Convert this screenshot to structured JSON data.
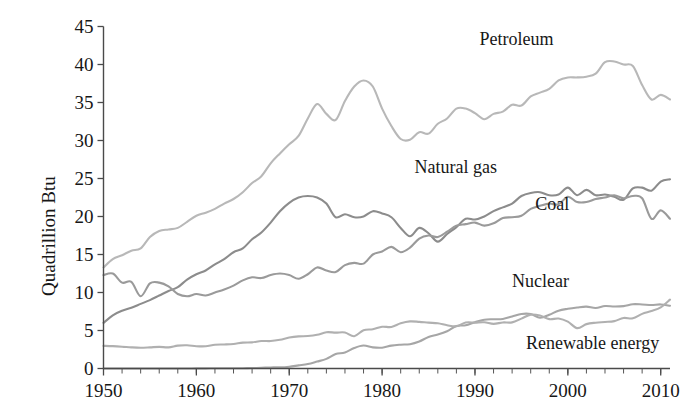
{
  "chart_data": {
    "type": "line",
    "title": "",
    "subtitle": "",
    "xlabel": "",
    "ylabel": "Quadrillion Btu",
    "xlim": [
      1950,
      2011
    ],
    "ylim": [
      0,
      45
    ],
    "grid": false,
    "legend_position": "inline-annotations",
    "y_ticks": [
      0,
      5,
      10,
      15,
      20,
      25,
      30,
      35,
      40,
      45
    ],
    "y_tick_labels": [
      "0",
      "5",
      "10",
      "15",
      "20",
      "25",
      "30",
      "35",
      "40",
      "45"
    ],
    "x_ticks": [
      1950,
      1960,
      1970,
      1980,
      1990,
      2000,
      2010
    ],
    "x_tick_labels": [
      "1950",
      "1960",
      "1970",
      "1980",
      "1990",
      "2000",
      "2010"
    ],
    "x_minor_tick_step": 2,
    "x": [
      1950,
      1951,
      1952,
      1953,
      1954,
      1955,
      1956,
      1957,
      1958,
      1959,
      1960,
      1961,
      1962,
      1963,
      1964,
      1965,
      1966,
      1967,
      1968,
      1969,
      1970,
      1971,
      1972,
      1973,
      1974,
      1975,
      1976,
      1977,
      1978,
      1979,
      1980,
      1981,
      1982,
      1983,
      1984,
      1985,
      1986,
      1987,
      1988,
      1989,
      1990,
      1991,
      1992,
      1993,
      1994,
      1995,
      1996,
      1997,
      1998,
      1999,
      2000,
      2001,
      2002,
      2003,
      2004,
      2005,
      2006,
      2007,
      2008,
      2009,
      2010,
      2011
    ],
    "series": [
      {
        "name": "Petroleum",
        "color": "#b8b8b8",
        "label_x": 1990.5,
        "label_y": 43.2,
        "values": [
          13.3,
          14.4,
          14.9,
          15.5,
          15.8,
          17.3,
          18.1,
          18.3,
          18.5,
          19.3,
          20.1,
          20.5,
          21.0,
          21.7,
          22.3,
          23.2,
          24.4,
          25.3,
          27.0,
          28.3,
          29.5,
          30.6,
          32.9,
          34.8,
          33.5,
          32.7,
          35.2,
          37.1,
          37.9,
          37.1,
          34.2,
          31.9,
          30.2,
          30.1,
          31.1,
          30.9,
          32.2,
          32.9,
          34.2,
          34.2,
          33.6,
          32.8,
          33.5,
          33.8,
          34.7,
          34.6,
          35.8,
          36.3,
          36.8,
          37.9,
          38.3,
          38.3,
          38.4,
          38.8,
          40.3,
          40.4,
          40.0,
          39.8,
          37.3,
          35.4,
          36.0,
          35.4
        ]
      },
      {
        "name": "Natural gas",
        "color": "#8c8c8c",
        "label_x": 1983.5,
        "label_y": 26.4,
        "values": [
          6.0,
          7.0,
          7.6,
          8.0,
          8.5,
          9.0,
          9.6,
          10.2,
          10.7,
          11.7,
          12.4,
          12.9,
          13.7,
          14.4,
          15.3,
          15.8,
          17.0,
          17.9,
          19.2,
          20.7,
          21.8,
          22.5,
          22.7,
          22.5,
          21.7,
          19.9,
          20.3,
          19.9,
          20.0,
          20.7,
          20.4,
          19.9,
          18.5,
          17.4,
          18.5,
          17.8,
          16.7,
          17.7,
          18.6,
          19.7,
          19.6,
          20.0,
          20.7,
          21.2,
          21.7,
          22.7,
          23.1,
          23.2,
          22.8,
          22.9,
          23.8,
          22.8,
          23.5,
          22.8,
          22.9,
          22.6,
          22.2,
          23.7,
          23.8,
          23.4,
          24.6,
          24.9
        ]
      },
      {
        "name": "Coal",
        "color": "#9a9a9a",
        "label_x": 1996.5,
        "label_y": 21.5,
        "values": [
          12.3,
          12.5,
          11.3,
          11.4,
          9.5,
          11.2,
          11.3,
          10.8,
          9.8,
          9.5,
          9.8,
          9.6,
          10.0,
          10.4,
          10.9,
          11.6,
          12.0,
          11.9,
          12.3,
          12.5,
          12.3,
          11.8,
          12.4,
          13.3,
          12.9,
          12.7,
          13.6,
          13.9,
          13.8,
          15.0,
          15.4,
          16.0,
          15.3,
          15.9,
          17.1,
          17.5,
          17.3,
          18.0,
          18.8,
          19.0,
          19.2,
          18.8,
          19.1,
          19.8,
          19.9,
          20.1,
          21.0,
          21.4,
          21.7,
          21.6,
          22.6,
          21.9,
          21.9,
          22.3,
          22.5,
          22.8,
          22.4,
          22.7,
          22.4,
          19.7,
          20.8,
          19.7
        ]
      },
      {
        "name": "Nuclear",
        "color": "#a6a6a6",
        "label_x": 1994.0,
        "label_y": 11.4,
        "values": [
          0.0,
          0.0,
          0.0,
          0.0,
          0.0,
          0.0,
          0.0,
          0.0,
          0.0,
          0.0,
          0.01,
          0.02,
          0.03,
          0.04,
          0.04,
          0.04,
          0.06,
          0.09,
          0.14,
          0.15,
          0.24,
          0.41,
          0.58,
          0.91,
          1.27,
          1.9,
          2.11,
          2.7,
          3.02,
          2.78,
          2.74,
          3.01,
          3.13,
          3.2,
          3.55,
          4.15,
          4.47,
          4.91,
          5.59,
          5.68,
          6.1,
          6.42,
          6.48,
          6.52,
          6.84,
          7.18,
          7.17,
          6.68,
          7.07,
          7.61,
          7.86,
          8.03,
          8.14,
          7.96,
          8.22,
          8.16,
          8.21,
          8.46,
          8.43,
          8.35,
          8.43,
          8.26
        ]
      },
      {
        "name": "Renewable energy",
        "color": "#b0b0b0",
        "label_x": 1995.5,
        "label_y": 3.2,
        "values": [
          2.98,
          2.94,
          2.87,
          2.78,
          2.73,
          2.78,
          2.85,
          2.78,
          3.01,
          3.06,
          2.93,
          2.92,
          3.12,
          3.16,
          3.23,
          3.4,
          3.44,
          3.62,
          3.61,
          3.78,
          4.07,
          4.23,
          4.27,
          4.43,
          4.77,
          4.72,
          4.74,
          4.25,
          5.04,
          5.17,
          5.49,
          5.47,
          5.95,
          6.2,
          6.14,
          6.03,
          5.95,
          5.69,
          5.55,
          6.05,
          6.04,
          6.08,
          5.87,
          6.06,
          6.07,
          6.56,
          7.09,
          6.97,
          6.5,
          6.57,
          6.16,
          5.31,
          5.84,
          6.03,
          6.12,
          6.23,
          6.65,
          6.6,
          7.19,
          7.56,
          8.05,
          9.07
        ]
      }
    ]
  },
  "annotations": {
    "petroleum": "Petroleum",
    "natural_gas": "Natural gas",
    "coal": "Coal",
    "nuclear": "Nuclear",
    "renewable": "Renewable energy"
  }
}
